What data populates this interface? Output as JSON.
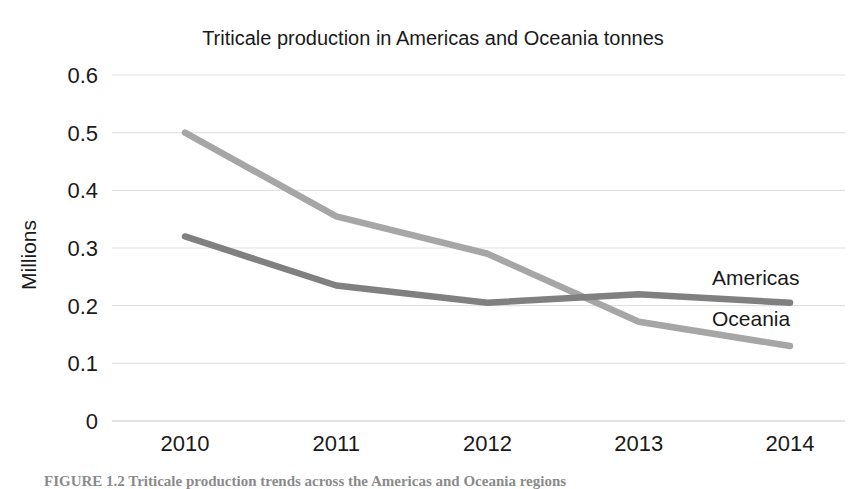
{
  "chart_data": {
    "type": "line",
    "title": "Triticale production in Americas and Oceania tonnes",
    "xlabel": "",
    "ylabel": "Millions",
    "categories": [
      "2010",
      "2011",
      "2012",
      "2013",
      "2014"
    ],
    "x": [
      2010,
      2011,
      2012,
      2013,
      2014
    ],
    "ylim": [
      0,
      0.6
    ],
    "yticks": [
      "0",
      "0.1",
      "0.2",
      "0.3",
      "0.4",
      "0.5",
      "0.6"
    ],
    "ytick_values": [
      0,
      0.1,
      0.2,
      0.3,
      0.4,
      0.5,
      0.6
    ],
    "grid": "horizontal",
    "legend_position": "right-inline-labels",
    "series": [
      {
        "name": "Oceania",
        "color": "#a6a6a6",
        "values": [
          0.5,
          0.355,
          0.29,
          0.172,
          0.13
        ]
      },
      {
        "name": "Americas",
        "color": "#808080",
        "values": [
          0.32,
          0.235,
          0.205,
          0.22,
          0.205
        ]
      }
    ],
    "annotations": [
      {
        "text": "Americas",
        "series": "Americas"
      },
      {
        "text": "Oceania",
        "series": "Oceania"
      }
    ]
  },
  "figure": {
    "caption": "FIGURE 1.2  Triticale production trends across the Americas and Oceania regions"
  },
  "colors": {
    "background": "#ffffff",
    "text": "#1a1a1a",
    "gridline": "#e2e2e4",
    "axis": "#d9d9dc",
    "americas": "#808080",
    "oceania": "#a6a6a6"
  }
}
